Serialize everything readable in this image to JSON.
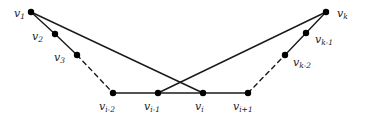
{
  "figure": {
    "kind": "undirected-graph-diagram",
    "width": 365,
    "height": 126,
    "background_color": "#ffffff",
    "stroke_color": "#1a1a1a",
    "node_fill_color": "#000000",
    "node_radius": 3.2,
    "edge_width": 1.4
  },
  "nodes": [
    {
      "id": "v1",
      "base": "v",
      "sub": "1",
      "x": 31,
      "y": 12,
      "label_x": 14,
      "label_y": 8,
      "label_pos": "left"
    },
    {
      "id": "v2",
      "base": "v",
      "sub": "2",
      "x": 55,
      "y": 34,
      "label_x": 32,
      "label_y": 31,
      "label_pos": "left"
    },
    {
      "id": "v3",
      "base": "v",
      "sub": "3",
      "x": 77,
      "y": 55,
      "label_x": 54,
      "label_y": 52,
      "label_pos": "left"
    },
    {
      "id": "vi-2",
      "base": "v",
      "sub": "i-2",
      "x": 113,
      "y": 93,
      "label_x": 99,
      "label_y": 101,
      "label_pos": "below"
    },
    {
      "id": "vi-1",
      "base": "v",
      "sub": "i-1",
      "x": 158,
      "y": 93,
      "label_x": 144,
      "label_y": 101,
      "label_pos": "below"
    },
    {
      "id": "vi",
      "base": "v",
      "sub": "i",
      "x": 203,
      "y": 93,
      "label_x": 195,
      "label_y": 101,
      "label_pos": "below"
    },
    {
      "id": "vi+1",
      "base": "v",
      "sub": "i+1",
      "x": 248,
      "y": 93,
      "label_x": 233,
      "label_y": 101,
      "label_pos": "below"
    },
    {
      "id": "vk-2",
      "base": "v",
      "sub": "k-2",
      "x": 285,
      "y": 55,
      "label_x": 293,
      "label_y": 57,
      "label_pos": "right"
    },
    {
      "id": "vk-1",
      "base": "v",
      "sub": "k-1",
      "x": 306,
      "y": 33,
      "label_x": 315,
      "label_y": 34,
      "label_pos": "right"
    },
    {
      "id": "vk",
      "base": "v",
      "sub": "k",
      "x": 326,
      "y": 12,
      "label_x": 337,
      "label_y": 8,
      "label_pos": "right"
    }
  ],
  "edges": [
    {
      "from": "v1",
      "to": "v2",
      "style": "solid",
      "role": "path-edge"
    },
    {
      "from": "v2",
      "to": "v3",
      "style": "solid",
      "role": "path-edge"
    },
    {
      "from": "v3",
      "to": "vi-2",
      "style": "dashed",
      "role": "path-ellipsis"
    },
    {
      "from": "vi-2",
      "to": "vi-1",
      "style": "solid",
      "role": "path-edge"
    },
    {
      "from": "vi-1",
      "to": "vi",
      "style": "solid",
      "role": "path-edge"
    },
    {
      "from": "vi",
      "to": "vi+1",
      "style": "solid",
      "role": "path-edge"
    },
    {
      "from": "vi+1",
      "to": "vk-2",
      "style": "dashed",
      "role": "path-ellipsis"
    },
    {
      "from": "vk-2",
      "to": "vk-1",
      "style": "solid",
      "role": "path-edge"
    },
    {
      "from": "vk-1",
      "to": "vk",
      "style": "solid",
      "role": "path-edge"
    },
    {
      "from": "v1",
      "to": "vi",
      "style": "solid",
      "role": "chord"
    },
    {
      "from": "vk",
      "to": "vi-1",
      "style": "solid",
      "role": "chord"
    }
  ],
  "dash_pattern": "4.5 4"
}
